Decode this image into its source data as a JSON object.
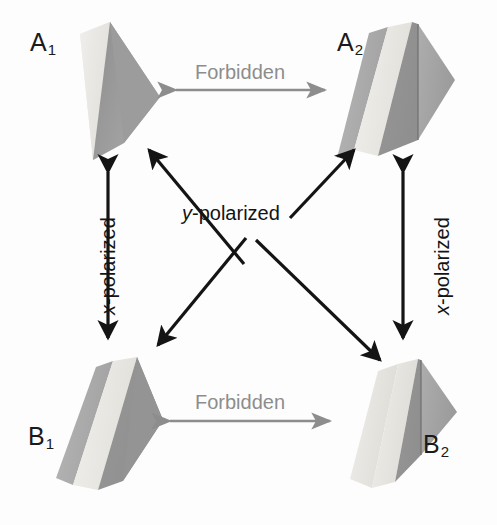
{
  "figure": {
    "type": "state-transition-diagram",
    "background_color": "#fdfdfd",
    "width": 497,
    "height": 525
  },
  "states": [
    {
      "id": "A1",
      "base": "A",
      "sub": "1",
      "label": "A",
      "subscript": "1",
      "position": "top-left",
      "label_x": 30,
      "label_y": 30,
      "shape": {
        "kind": "shaded-prism",
        "bands": [
          {
            "name": "front-light-face",
            "color": "#e8e6e2"
          },
          {
            "name": "side-dark-face",
            "color": "#9a9a9a"
          }
        ]
      }
    },
    {
      "id": "A2",
      "base": "A",
      "sub": "2",
      "label": "A",
      "subscript": "2",
      "position": "top-right",
      "label_x": 337,
      "label_y": 30,
      "shape": {
        "kind": "shaded-prism",
        "bands": [
          {
            "name": "left-medium-band",
            "color": "#aeaeae"
          },
          {
            "name": "center-light-band",
            "color": "#eceae6"
          },
          {
            "name": "right-dark-face",
            "color": "#9a9a9a"
          },
          {
            "name": "far-right-face",
            "color": "#a6a6a6"
          }
        ]
      }
    },
    {
      "id": "B1",
      "base": "B",
      "sub": "1",
      "label": "B",
      "subscript": "1",
      "position": "bottom-left",
      "label_x": 28,
      "label_y": 424,
      "shape": {
        "kind": "shaded-prism",
        "bands": [
          {
            "name": "left-medium-band",
            "color": "#aeaeae"
          },
          {
            "name": "center-light-band",
            "color": "#eceae6"
          },
          {
            "name": "right-dark-face",
            "color": "#9a9a9a"
          }
        ]
      }
    },
    {
      "id": "B2",
      "base": "B",
      "sub": "2",
      "label": "B",
      "subscript": "2",
      "position": "bottom-right",
      "label_x": 423,
      "label_y": 432,
      "shape": {
        "kind": "shaded-prism",
        "bands": [
          {
            "name": "front-light-face",
            "color": "#e8e6e2"
          },
          {
            "name": "side-dark-face",
            "color": "#9a9a9a"
          },
          {
            "name": "far-right-face",
            "color": "#a6a6a6"
          }
        ]
      }
    }
  ],
  "transitions": [
    {
      "id": "A1-A2",
      "label": "Forbidden",
      "kind": "forbidden",
      "orientation": "horizontal",
      "from": "A1",
      "to": "A2",
      "arrow_style": "double-headed",
      "color": "#8d8d8d",
      "label_x": 195,
      "label_y": 62
    },
    {
      "id": "B1-B2",
      "label": "Forbidden",
      "kind": "forbidden",
      "orientation": "horizontal",
      "from": "B1",
      "to": "B2",
      "arrow_style": "double-headed",
      "color": "#8d8d8d",
      "label_x": 195,
      "label_y": 392
    },
    {
      "id": "A1-B1",
      "label": "x-polarized",
      "label_italic_prefix": "x",
      "label_rest": "-polarized",
      "kind": "allowed",
      "orientation": "vertical",
      "from": "A1",
      "to": "B1",
      "arrow_style": "double-headed",
      "color": "#141414",
      "label_x": 118,
      "label_y": 315
    },
    {
      "id": "A2-B2",
      "label": "x-polarized",
      "label_italic_prefix": "x",
      "label_rest": "-polarized",
      "kind": "allowed",
      "orientation": "vertical",
      "from": "A2",
      "to": "B2",
      "arrow_style": "double-headed",
      "color": "#141414",
      "label_x": 432,
      "label_y": 315
    },
    {
      "id": "diagonals",
      "label": "y-polarized",
      "label_italic_prefix": "y",
      "label_rest": "-polarized",
      "kind": "allowed",
      "orientation": "diagonal-cross",
      "from": "A1,A2",
      "to": "B2,B1",
      "arrow_style": "double-headed",
      "color": "#141414",
      "label_x": 182,
      "label_y": 203
    }
  ],
  "colors": {
    "forbidden_arrow": "#8d8d8d",
    "allowed_arrow": "#141414",
    "label_text": "#1a1a1a",
    "forbidden_text": "#8d8d8d",
    "prism_light": "#e8e6e2",
    "prism_medium": "#aeaeae",
    "prism_dark": "#9a9a9a",
    "background": "#fdfdfd"
  }
}
